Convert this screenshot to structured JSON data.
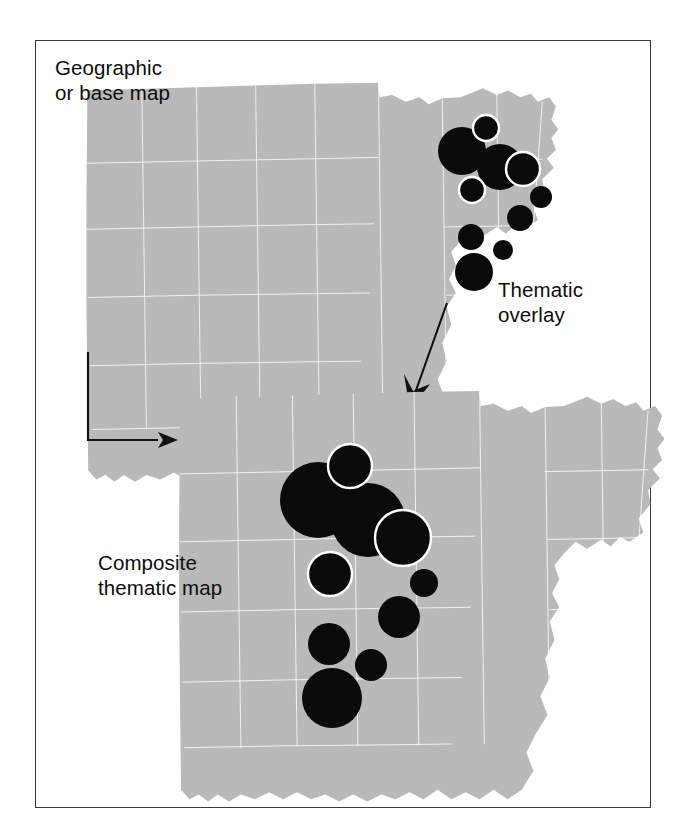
{
  "figure": {
    "title_text_present": false,
    "background": "#ffffff",
    "frame_color": "#3a3a3a",
    "land_color": "#b9b9b9",
    "boundary_color": "#ffffff",
    "symbol_color": "#0a0a0a"
  },
  "labels": {
    "base_map": "Geographic\nor base map",
    "overlay": "Thematic\noverlay",
    "composite": "Composite\nthematic map"
  },
  "arrows": [
    {
      "name": "base-to-composite-arrow",
      "shape": "elbow",
      "from": [
        88,
        352
      ],
      "corner": [
        88,
        440
      ],
      "to": [
        168,
        440
      ],
      "direction": "right"
    },
    {
      "name": "overlay-to-composite-arrow",
      "shape": "diagonal",
      "from": [
        447,
        303
      ],
      "to": [
        410,
        408
      ],
      "direction": "down-left"
    }
  ],
  "chart_data": {
    "type": "proportional-symbol-map",
    "panels": [
      {
        "name": "base-map",
        "label": "Geographic or base map",
        "has_symbols": false,
        "bbox": [
          60,
          70,
          330,
          345
        ]
      },
      {
        "name": "thematic-overlay",
        "label": "Thematic overlay",
        "has_symbols": true,
        "bbox": [
          430,
          105,
          560,
          295
        ]
      },
      {
        "name": "composite-thematic-map",
        "label": "Composite thematic map",
        "has_symbols": true,
        "bbox": [
          150,
          375,
          640,
          790
        ]
      }
    ],
    "symbols_overlay": [
      {
        "id": "s1",
        "cx": 486,
        "cy": 128,
        "r": 13,
        "ring": false
      },
      {
        "id": "s2",
        "cx": 462,
        "cy": 151,
        "r": 24,
        "ring": false
      },
      {
        "id": "s3",
        "cx": 500,
        "cy": 167,
        "r": 23,
        "ring": false
      },
      {
        "id": "s4",
        "cx": 523,
        "cy": 169,
        "r": 17,
        "ring": true
      },
      {
        "id": "s5",
        "cx": 472,
        "cy": 190,
        "r": 13,
        "ring": true
      },
      {
        "id": "s6",
        "cx": 541,
        "cy": 197,
        "r": 11,
        "ring": false
      },
      {
        "id": "s7",
        "cx": 520,
        "cy": 218,
        "r": 13,
        "ring": false
      },
      {
        "id": "s8",
        "cx": 471,
        "cy": 237,
        "r": 13,
        "ring": false
      },
      {
        "id": "s9",
        "cx": 503,
        "cy": 250,
        "r": 10,
        "ring": false
      },
      {
        "id": "s10",
        "cx": 474,
        "cy": 272,
        "r": 19,
        "ring": false
      }
    ],
    "symbols_composite": [
      {
        "id": "c1",
        "cx": 350,
        "cy": 466,
        "r": 22,
        "ring": true
      },
      {
        "id": "c2",
        "cx": 318,
        "cy": 500,
        "r": 38,
        "ring": false
      },
      {
        "id": "c3",
        "cx": 368,
        "cy": 520,
        "r": 37,
        "ring": false
      },
      {
        "id": "c4",
        "cx": 403,
        "cy": 538,
        "r": 28,
        "ring": true
      },
      {
        "id": "c5",
        "cx": 330,
        "cy": 574,
        "r": 22,
        "ring": true
      },
      {
        "id": "c6",
        "cx": 424,
        "cy": 583,
        "r": 14,
        "ring": false
      },
      {
        "id": "c7",
        "cx": 399,
        "cy": 617,
        "r": 21,
        "ring": false
      },
      {
        "id": "c8",
        "cx": 329,
        "cy": 644,
        "r": 21,
        "ring": false
      },
      {
        "id": "c9",
        "cx": 371,
        "cy": 665,
        "r": 16,
        "ring": false
      },
      {
        "id": "c10",
        "cx": 332,
        "cy": 698,
        "r": 30,
        "ring": false
      }
    ],
    "symbol_size_meaning": "circle area proportional to a mapped quantity per place",
    "legend": null,
    "xlabel": "",
    "ylabel": "",
    "grid": false
  }
}
